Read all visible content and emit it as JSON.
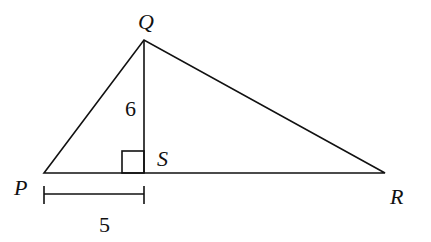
{
  "diagram": {
    "type": "geometry",
    "vertices": {
      "P": "P",
      "Q": "Q",
      "R": "R",
      "S": "S"
    },
    "labels": {
      "QS_length": "6",
      "PS_length": "5"
    },
    "stroke_color": "#111111"
  }
}
